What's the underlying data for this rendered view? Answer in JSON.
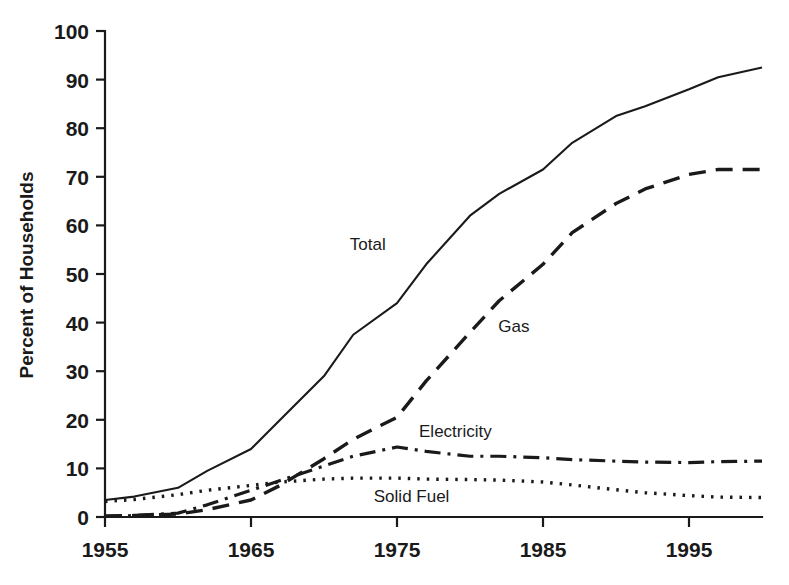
{
  "chart_data": {
    "type": "line",
    "title": "",
    "xlabel": "",
    "ylabel": "Percent of Households",
    "xlim": [
      1955,
      2000
    ],
    "ylim": [
      0,
      100
    ],
    "grid": false,
    "legend_position": "inline-labels",
    "x_ticks": [
      "1955",
      "1965",
      "1975",
      "1985",
      "1995"
    ],
    "x_tick_values": [
      1955,
      1965,
      1975,
      1985,
      1995
    ],
    "y_ticks": [
      "0",
      "10",
      "20",
      "30",
      "40",
      "50",
      "60",
      "70",
      "80",
      "90",
      "100"
    ],
    "y_tick_values": [
      0,
      10,
      20,
      30,
      40,
      50,
      60,
      70,
      80,
      90,
      100
    ],
    "x": [
      1955,
      1957,
      1960,
      1962,
      1965,
      1967,
      1970,
      1972,
      1975,
      1977,
      1980,
      1982,
      1985,
      1987,
      1990,
      1992,
      1995,
      1997,
      2000
    ],
    "series": [
      {
        "name": "Total",
        "label": "Total",
        "style": "solid",
        "color": "#1a1a1a",
        "values": [
          3.5,
          4.2,
          6.0,
          9.5,
          14.0,
          20.0,
          29.0,
          37.5,
          44.0,
          52.0,
          62.0,
          66.5,
          71.5,
          77.0,
          82.5,
          84.5,
          88.0,
          90.5,
          92.5
        ],
        "label_position": {
          "x": 1973,
          "y": 55
        }
      },
      {
        "name": "Gas",
        "label": "Gas",
        "style": "dashed",
        "color": "#1a1a1a",
        "values": [
          0.2,
          0.3,
          0.6,
          1.5,
          3.5,
          6.5,
          12.0,
          16.0,
          20.5,
          28.0,
          38.0,
          44.5,
          52.0,
          58.5,
          64.5,
          67.5,
          70.5,
          71.5,
          71.5
        ],
        "label_position": {
          "x": 1983,
          "y": 38
        }
      },
      {
        "name": "Electricity",
        "label": "Electricity",
        "style": "dashdot",
        "color": "#1a1a1a",
        "values": [
          0.1,
          0.3,
          0.8,
          2.5,
          5.5,
          7.5,
          10.5,
          12.5,
          14.4,
          13.5,
          12.5,
          12.5,
          12.2,
          11.8,
          11.5,
          11.3,
          11.2,
          11.4,
          11.5
        ],
        "label_position": {
          "x": 1979,
          "y": 16.5
        }
      },
      {
        "name": "Solid Fuel",
        "label": "Solid Fuel",
        "style": "dotted",
        "color": "#1a1a1a",
        "values": [
          3.2,
          3.6,
          4.6,
          5.5,
          6.5,
          7.2,
          7.8,
          8.0,
          8.0,
          7.8,
          7.7,
          7.6,
          7.2,
          6.6,
          5.6,
          5.0,
          4.4,
          4.1,
          4.0
        ],
        "label_position": {
          "x": 1976,
          "y": 3.0
        }
      }
    ]
  },
  "axis": {
    "y_title": "Percent of Households"
  }
}
